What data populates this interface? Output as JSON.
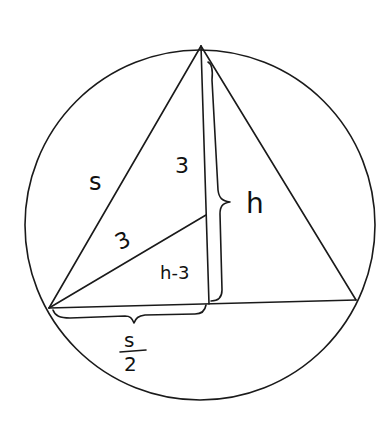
{
  "diagram": {
    "stroke_color": "#1a1a1a",
    "background": "#ffffff",
    "circle": {
      "cx": 200,
      "cy": 225,
      "r": 175
    },
    "vertices": {
      "top": [
        201,
        46
      ],
      "left": [
        49,
        308
      ],
      "right": [
        356,
        300
      ]
    },
    "altitude_foot": [
      209,
      304
    ],
    "center_point": [
      206,
      215
    ],
    "labels": {
      "side": "s",
      "radius_upper": "3",
      "radius_lower": "3",
      "lower_segment": "h-3",
      "height": "h",
      "half_side_numerator": "s",
      "half_side_denominator": "2"
    }
  }
}
